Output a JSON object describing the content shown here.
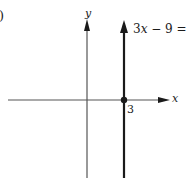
{
  "figure": {
    "partial_label": ")",
    "axes": {
      "x_label": "x",
      "y_label": "y"
    },
    "line": {
      "equation": "3x − 9 = 0",
      "equation_parts": {
        "coef": "3",
        "var": "x",
        "rest": " − 9 = 0"
      },
      "x_intercept_label": "3",
      "x_intercept": 3,
      "type": "vertical"
    },
    "colors": {
      "axis": "#555555",
      "line": "#1a1a1a",
      "text": "#1a1a1a"
    }
  }
}
